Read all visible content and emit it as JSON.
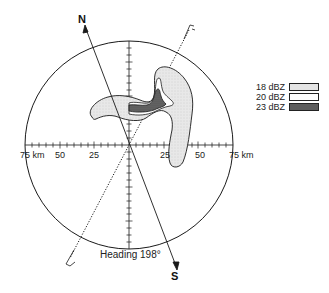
{
  "figure": {
    "north_label": "N",
    "south_label": "S",
    "heading_text": "Heading 198°",
    "range_unit": "km",
    "axis_labels": {
      "left": [
        "75 km",
        "50",
        "25"
      ],
      "right": [
        "25",
        "50",
        "75 km"
      ]
    },
    "range_rings_km": [
      25,
      50,
      75
    ],
    "max_range_km": 75
  },
  "legend": {
    "items": [
      {
        "label": "18 dBZ",
        "fill": "#e6e6e6",
        "pattern": "light-stipple"
      },
      {
        "label": "20 dBZ",
        "fill": "#ffffff",
        "pattern": "none"
      },
      {
        "label": "23 dBZ",
        "fill": "#5a5a5a",
        "pattern": "dark-stipple"
      }
    ]
  },
  "colors": {
    "line": "#1a1a1a",
    "echo_18": "#e4e4e4",
    "echo_20": "#ffffff",
    "echo_23": "#5c5c5c"
  }
}
